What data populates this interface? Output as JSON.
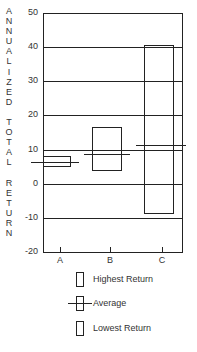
{
  "chart_data": {
    "type": "box",
    "title": "",
    "xlabel": "",
    "ylabel": "ANNUALIZED TOTAL RETURN",
    "ylim": [
      -20,
      50
    ],
    "yticks": [
      50,
      40,
      30,
      20,
      10,
      0,
      -10,
      -20
    ],
    "grid": "horizontal",
    "categories": [
      "A",
      "B",
      "C"
    ],
    "series": [
      {
        "name": "Highest Return",
        "values": [
          8.2,
          16.5,
          40.6
        ]
      },
      {
        "name": "Average",
        "values": [
          6.5,
          8.8,
          11.2
        ]
      },
      {
        "name": "Lowest Return",
        "values": [
          5.0,
          3.8,
          -8.8
        ]
      }
    ],
    "legend_position": "bottom"
  },
  "ylabel_letters": [
    "A",
    "N",
    "N",
    "U",
    "A",
    "L",
    "I",
    "Z",
    "E",
    "D",
    "",
    "T",
    "O",
    "T",
    "A",
    "L",
    "",
    "R",
    "E",
    "T",
    "U",
    "R",
    "N"
  ],
  "ytick_labels": [
    "50",
    "40",
    "30",
    "20",
    "10",
    "0",
    "-10",
    "-20"
  ],
  "xtick_labels": [
    "A",
    "B",
    "C"
  ],
  "legend": {
    "highest": "Highest Return",
    "average": "Average",
    "lowest": "Lowest Return"
  }
}
